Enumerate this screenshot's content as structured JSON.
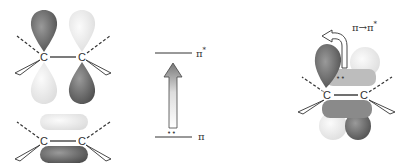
{
  "left_panel": {
    "p_orbitals": {
      "atom_left": "C",
      "atom_right": "C"
    },
    "pi_bond": {
      "atom_left": "C",
      "atom_right": "C"
    }
  },
  "energy_diagram": {
    "upper_level_label": "π",
    "upper_level_sup": "*",
    "lower_level_label": "π",
    "electrons": "••"
  },
  "right_panel": {
    "transition_label": "π→π",
    "transition_sup": "*",
    "atom_left": "C",
    "atom_right": "C",
    "electrons": "••"
  },
  "colors": {
    "dark_lobe": "#6e6e6e",
    "light_lobe": "#e6e6e6",
    "line": "#333333"
  }
}
